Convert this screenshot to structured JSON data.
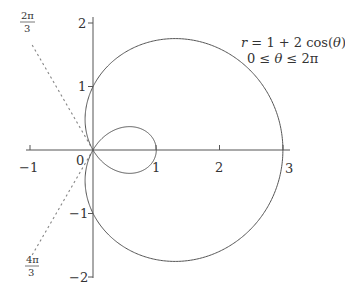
{
  "chart_data": {
    "type": "line",
    "subtype": "polar-curve",
    "title": "",
    "annotations": {
      "equation": "r = 1 + 2 cos(θ)",
      "domain": "0 ≤ θ ≤ 2π",
      "angle_label_1": {
        "num": "2π",
        "den": "3"
      },
      "angle_label_2": {
        "num": "4π",
        "den": "3"
      }
    },
    "equation_parts": {
      "r": "r",
      "eq": " = 1 + 2 cos(",
      "theta": "θ",
      "close": ")"
    },
    "domain_parts": {
      "lhs": "0 ≤ ",
      "theta": "θ",
      "rhs": " ≤ 2π"
    },
    "xlabel": "",
    "ylabel": "",
    "xlim": [
      -1.05,
      3.1
    ],
    "ylim": [
      -2.05,
      2.1
    ],
    "x_ticks": [
      -1,
      0,
      1,
      2,
      3
    ],
    "x_tick_labels": [
      "−1",
      "0",
      "1",
      "2",
      "3"
    ],
    "y_ticks": [
      -2,
      -1,
      1,
      2
    ],
    "y_tick_labels": [
      "−2",
      "−1",
      "1",
      "2"
    ],
    "grid": false,
    "legend": null,
    "series": [
      {
        "name": "r = 1 + 2cos(θ)",
        "kind": "limaçon with inner loop",
        "theta_range": [
          0,
          6.2832
        ],
        "key_points": [
          {
            "theta": "0",
            "x": 3,
            "y": 0
          },
          {
            "theta": "π/2",
            "x": 0,
            "y": 1
          },
          {
            "theta": "2π/3",
            "x": 0,
            "y": 0
          },
          {
            "theta": "π",
            "x": 1,
            "y": 0
          },
          {
            "theta": "4π/3",
            "x": 0,
            "y": 0
          },
          {
            "theta": "3π/2",
            "x": 0,
            "y": -1
          }
        ],
        "color": "#555555"
      }
    ],
    "reference_lines": [
      {
        "angle": "2π/3",
        "style": "dotted",
        "from": [
          0,
          0
        ],
        "to": [
          -0.98,
          1.7
        ]
      },
      {
        "angle": "4π/3",
        "style": "dotted",
        "from": [
          0,
          0
        ],
        "to": [
          -0.98,
          -1.7
        ]
      }
    ],
    "colors": {
      "curve": "#555555",
      "axes": "#555555",
      "dotted": "#888888",
      "text": "#333333"
    }
  }
}
